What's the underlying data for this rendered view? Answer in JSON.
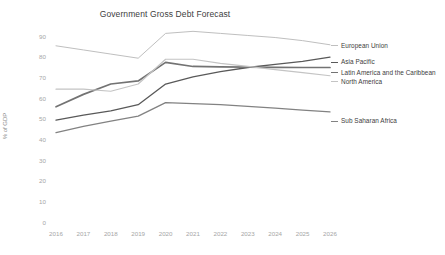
{
  "chart_data": {
    "type": "line",
    "title": "Government Gross Debt Forecast",
    "xlabel": "",
    "ylabel": "% of GDP",
    "grid": false,
    "legend_position": "right-inline",
    "ylim": [
      0,
      90
    ],
    "yticks": [
      "0",
      "10",
      "20",
      "30",
      "40",
      "50",
      "60",
      "70",
      "80",
      "90"
    ],
    "categories": [
      "2016",
      "2017",
      "2018",
      "2019",
      "2020",
      "2021",
      "2022",
      "2023",
      "2024",
      "2025",
      "2026"
    ],
    "series": [
      {
        "name": "European Union",
        "color": "#bfbfbf",
        "width": 1.0,
        "values": [
          85.5,
          83.5,
          81.5,
          79.5,
          91.5,
          92.5,
          91.5,
          90.5,
          89.5,
          88.0,
          86.0
        ]
      },
      {
        "name": "Asia Pacific",
        "color": "#595959",
        "width": 1.3,
        "values": [
          49.5,
          52.0,
          54.0,
          57.0,
          67.0,
          70.5,
          73.0,
          75.0,
          76.5,
          78.0,
          80.0
        ]
      },
      {
        "name": "Latin America and the Caribbean",
        "color": "#737373",
        "width": 1.7,
        "values": [
          56.0,
          62.0,
          67.0,
          68.5,
          77.5,
          75.5,
          75.3,
          75.2,
          75.1,
          75.0,
          75.0
        ]
      },
      {
        "name": "North America",
        "color": "#c4c4c4",
        "width": 1.2,
        "values": [
          64.5,
          64.5,
          63.5,
          67.0,
          79.0,
          79.0,
          77.0,
          75.5,
          74.0,
          72.5,
          71.0
        ]
      },
      {
        "name": "Sub Saharan Africa",
        "color": "#828282",
        "width": 1.3,
        "values": [
          43.5,
          46.5,
          49.0,
          51.5,
          58.0,
          57.5,
          57.0,
          56.2,
          55.3,
          54.4,
          53.5
        ]
      }
    ]
  },
  "labels": {
    "european_union": "European Union",
    "asia_pacific": "Asia Pacific",
    "latin_america": "Latin America and the Caribbean",
    "north_america": "North America",
    "sub_saharan_africa": "Sub Saharan Africa"
  }
}
